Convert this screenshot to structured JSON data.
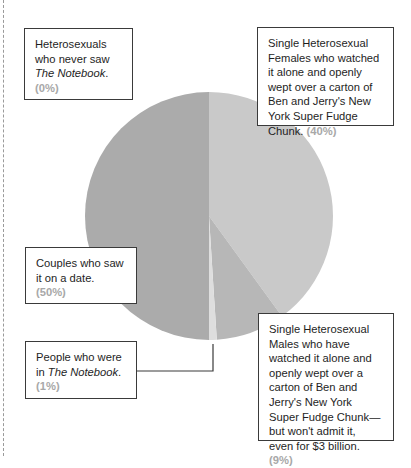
{
  "chart_data": {
    "type": "pie",
    "title": "",
    "start_angle": "12 o'clock, clockwise",
    "slices": [
      {
        "label": "Single Heterosexual Females who watched it alone and openly wept over a carton of Ben and Jerry's New York Super Fudge Chunk.",
        "value": 40,
        "color": "#c9c9c9"
      },
      {
        "label": "Single Heterosexual Males who have watched it alone and openly wept over a carton of Ben and Jerry's New York Super Fudge Chunk—but won't admit it, even for $3 billion.",
        "value": 9,
        "color": "#b7b7b7"
      },
      {
        "label": "People who were in The Notebook.",
        "value": 1,
        "color": "#dedede"
      },
      {
        "label": "Couples who saw it on a date.",
        "value": 50,
        "color": "#ababab"
      },
      {
        "label": "Heterosexuals who never saw The Notebook.",
        "value": 0,
        "color": "#ffffff"
      }
    ],
    "legend": "callout boxes"
  },
  "labels": {
    "never_saw": {
      "text": "Heterosexuals who never saw ",
      "italic": "The Notebook",
      "tail": ".",
      "pct": "(0%)"
    },
    "females": {
      "text": "Single Heterosexual Females who watched it alone and openly wept over a carton of Ben and Jerry's New York Super Fudge Chunk.",
      "pct": "(40%)"
    },
    "couples": {
      "text": "Couples who saw it on a date.",
      "pct": "(50%)"
    },
    "cast": {
      "text": "People who were in ",
      "italic": "The Notebook",
      "tail": ".",
      "pct": "(1%)"
    },
    "males": {
      "text": "Single Heterosexual Males who have watched it alone and openly wept over a carton of Ben and Jerry's New York Super Fudge Chunk—but won't admit it, even for $3 billion.",
      "pct": "(9%)"
    }
  }
}
